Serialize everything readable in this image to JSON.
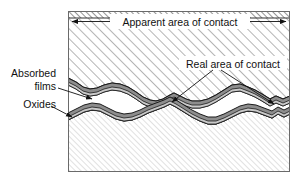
{
  "figure": {
    "type": "technical-diagram",
    "background_color": "#ffffff",
    "frame": {
      "stroke": "#555555",
      "x": 68,
      "y": 11,
      "width": 222,
      "height": 161
    },
    "annotations": {
      "apparent_area": {
        "label": "Apparent area of contact",
        "kind": "dimension-arrow",
        "placement": "top",
        "arrow_left_x": 71,
        "arrow_right_x": 287,
        "arrow_y": 21
      },
      "real_area": {
        "label": "Real area of contact",
        "kind": "leader-label",
        "placement": "upper-right",
        "text_x": 182,
        "text_y": 65,
        "leaders": 2
      },
      "absorbed_films": {
        "line1": "Absorbed",
        "line2": "films",
        "kind": "leader-label",
        "placement": "left",
        "text_x": 55,
        "text_y_line1": 73,
        "text_y_line2": 86
      },
      "oxides": {
        "label": "Oxides",
        "kind": "leader-label",
        "placement": "left",
        "text_x": 55,
        "text_y": 103
      }
    },
    "layers": {
      "upper_body": {
        "name": "Upper solid body",
        "fill": "hatch-coarse",
        "hatch_color": "#6b6b6b",
        "hatch_direction": "45deg-up-right"
      },
      "lower_body": {
        "name": "Lower solid body",
        "fill": "hatch-fine",
        "hatch_color": "#a8a8a8",
        "hatch_direction": "45deg-up-right"
      },
      "film_band": {
        "name": "Absorbed film / oxide band",
        "fill": "#8d8d8d",
        "stroke": "#1a1a1a"
      },
      "inner_band": {
        "name": "Inner oxide sublayer",
        "fill": "#c9c9c9",
        "stroke": "#1a1a1a"
      },
      "gap": {
        "name": "Void between surfaces",
        "fill": "#ffffff"
      },
      "top_edge_band": {
        "name": "Top edge dense hatch band",
        "fill": "hatch-dense",
        "hatch_color": "#444444"
      }
    }
  }
}
